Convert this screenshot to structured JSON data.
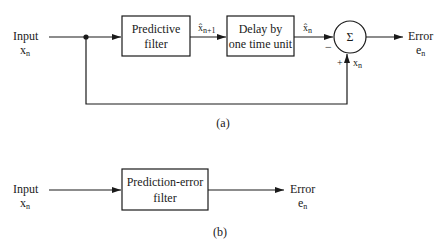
{
  "diagram_a": {
    "caption": "(a)",
    "input_label": "Input",
    "input_var": "x",
    "input_sub": "n",
    "predictive_filter": [
      "Predictive",
      "filter"
    ],
    "predicted_label": "x̂",
    "predicted_sub": "n+1",
    "delay_block": [
      "Delay by",
      "one time unit"
    ],
    "delayed_label": "x̂",
    "delayed_sub": "n",
    "summer_symbol": "Σ",
    "minus_sign": "−",
    "plus_sign": "+",
    "feedback_var": "x",
    "feedback_sub": "n",
    "output_label": "Error",
    "output_var": "e",
    "output_sub": "n"
  },
  "diagram_b": {
    "caption": "(b)",
    "input_label": "Input",
    "input_var": "x",
    "input_sub": "n",
    "filter_block": [
      "Prediction-error",
      "filter"
    ],
    "output_label": "Error",
    "output_var": "e",
    "output_sub": "n"
  }
}
